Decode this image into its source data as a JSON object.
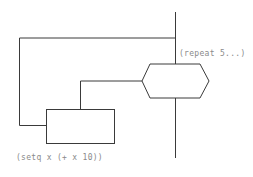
{
  "diagram": {
    "nodes": [
      {
        "id": "repeat",
        "shape": "hexagon",
        "label": "(repeat 5...)"
      },
      {
        "id": "setq",
        "shape": "rectangle",
        "label": "(setq x (+ x 10))"
      }
    ],
    "edges": [
      {
        "from": "main-line",
        "to": "repeat"
      },
      {
        "from": "repeat",
        "to": "setq"
      },
      {
        "from": "setq",
        "to": "main-line",
        "type": "loop-back"
      }
    ],
    "colors": {
      "line": "#3a3a3a",
      "text": "#8a8a8a",
      "background": "#ffffff"
    }
  }
}
